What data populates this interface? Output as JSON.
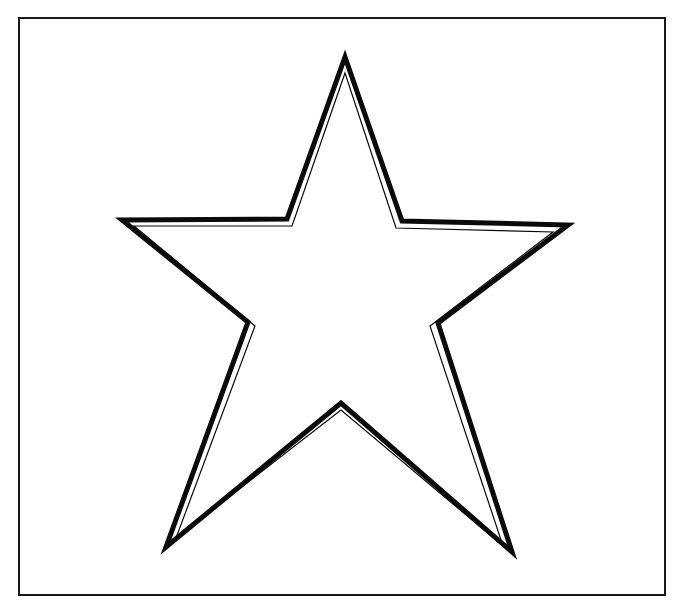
{
  "page": {
    "width": 679,
    "height": 607,
    "background_color": "#ffffff",
    "ink_color": "#0a0a0a"
  },
  "frame": {
    "name": "border-rectangle",
    "x": 19,
    "y": 18,
    "width": 646,
    "height": 577,
    "stroke_width": 2,
    "stroke_color": "#1a1a1a",
    "fill": "none"
  },
  "figure": {
    "label": "five-pointed-star",
    "outer_stroke_width": 5,
    "inner_stroke_width": 1.2,
    "stroke_color": "#0a0a0a",
    "fill_color": "#ffffff",
    "points_count": 5,
    "vertices": {
      "tip_top": [
        345,
        57
      ],
      "valley_upper_right": [
        402,
        221
      ],
      "tip_right": [
        568,
        225
      ],
      "valley_lower_right": [
        438,
        323
      ],
      "tip_bottom_right": [
        512,
        552
      ],
      "valley_bottom": [
        341,
        403
      ],
      "tip_bottom_left": [
        166,
        547
      ],
      "valley_lower_left": [
        248,
        322
      ],
      "tip_left": [
        122,
        220
      ],
      "valley_upper_left": [
        287,
        219
      ]
    },
    "outer_path": "M 345 57 L 402 221 L 568 225 L 438 323 L 512 552 L 341 403 L 166 547 L 248 322 L 122 220 L 287 219 Z",
    "inner_path": "M 345 73 L 396 228 L 553 232 L 430 326 L 503 546 L 341 410 L 176 538 L 255 326 L 134 226 L 292 226 Z"
  },
  "chart_data": {
    "type": "table",
    "categories": [
      "tip_top",
      "valley_upper_right",
      "tip_right",
      "valley_lower_right",
      "tip_bottom_right",
      "valley_bottom",
      "tip_bottom_left",
      "valley_lower_left",
      "tip_left",
      "valley_upper_left"
    ],
    "values": [
      57,
      221,
      225,
      323,
      552,
      403,
      547,
      322,
      220,
      219
    ],
    "xlabel": "vertex",
    "ylabel": "y (px)",
    "grid": false,
    "legend": "none"
  }
}
